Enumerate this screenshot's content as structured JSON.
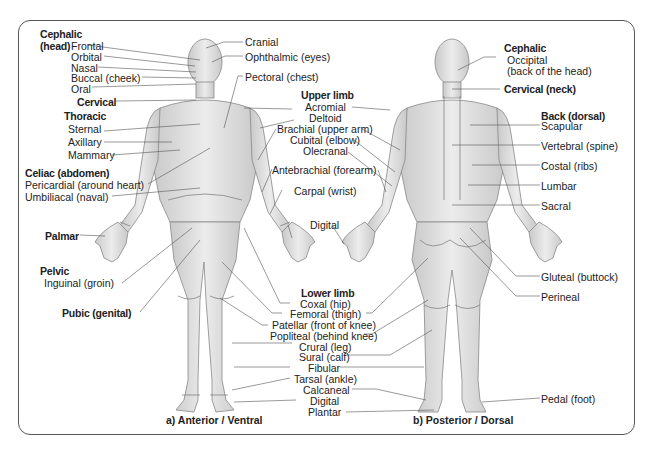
{
  "figure": {
    "anterior_caption": "a) Anterior / Ventral",
    "posterior_caption": "b) Posterior / Dorsal"
  },
  "anterior": {
    "cephalic": {
      "heading": "Cephalic",
      "heading2": "(head)",
      "frontal": "Frontal",
      "orbital": "Orbital",
      "nasal": "Nasal",
      "buccal": "Buccal (cheek)",
      "oral": "Oral"
    },
    "cervical": "Cervical",
    "thoracic": {
      "heading": "Thoracic",
      "sternal": "Sternal",
      "axillary": "Axillary",
      "mammary": "Mammary"
    },
    "celiac": {
      "heading": "Celiac (abdomen)",
      "pericardial": "Pericardial (around heart)",
      "umbilical": "Umbiliacal (naval)"
    },
    "palmar": "Palmar",
    "pelvic": {
      "heading": "Pelvic",
      "inguinal": "Inguinal (groin)"
    },
    "pubic": "Pubic (genital)",
    "cranial": "Cranial",
    "ophthalmic": "Ophthalmic (eyes)",
    "pectoral": "Pectoral (chest)"
  },
  "upper_limb": {
    "heading": "Upper limb",
    "items": [
      "Acromial",
      "Deltoid",
      "Brachial (upper arm)",
      "Cubital (elbow)",
      "Olecranal",
      "Antebrachial (forearm)",
      "Carpal (wrist)",
      "Digital"
    ]
  },
  "lower_limb": {
    "heading": "Lower limb",
    "items": [
      "Coxal (hip)",
      "Femoral (thigh)",
      "Patellar (front of knee)",
      "Popliteal (behind knee)",
      "Crural (leg)",
      "Sural (calf)",
      "Fibular",
      "Tarsal (ankle)",
      "Calcaneal",
      "Digital",
      "Plantar"
    ]
  },
  "posterior": {
    "cephalic": "Cephalic",
    "occipital": "Occipital",
    "occipital2": "(back of the head)",
    "cervical": "Cervical (neck)",
    "back": "Back (dorsal)",
    "scapular": "Scapular",
    "vertebral": "Vertebral (spine)",
    "costal": "Costal (ribs)",
    "lumbar": "Lumbar",
    "sacral": "Sacral",
    "gluteal": "Gluteal (buttock)",
    "perineal": "Perineal",
    "pedal": "Pedal (foot)"
  }
}
